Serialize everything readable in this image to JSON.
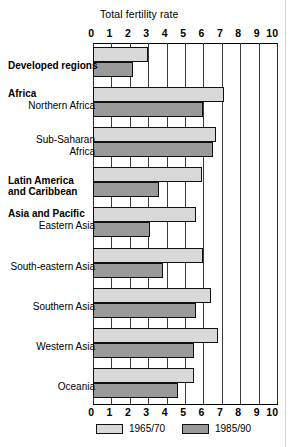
{
  "chart_data": {
    "type": "bar",
    "orientation": "horizontal",
    "title": "Total fertility rate",
    "xlabel": "",
    "ylabel": "",
    "xlim": [
      0,
      10
    ],
    "xticks": [
      0,
      1,
      2,
      3,
      4,
      5,
      6,
      7,
      8,
      9,
      10
    ],
    "xtick_labels": [
      "0",
      "1",
      "2",
      "3",
      "4",
      "5",
      "6",
      "7",
      "8",
      "9",
      "10"
    ],
    "grid": true,
    "axis_labels_position": "top-and-bottom",
    "legend_position": "bottom-center",
    "categories": [
      "Developed regions",
      "Northern Africa",
      "Sub-Saharan Africa",
      "Latin America and Caribbean",
      "Eastern Asia",
      "South-eastern Asia",
      "Southern Asia",
      "Western Asia",
      "Oceania"
    ],
    "series": [
      {
        "name": "1965/70",
        "color": "#d9d9d9",
        "values": [
          3.0,
          7.1,
          6.7,
          5.9,
          5.6,
          6.0,
          6.4,
          6.8,
          5.5
        ]
      },
      {
        "name": "1985/90",
        "color": "#9a9a9a",
        "values": [
          2.2,
          6.0,
          6.5,
          3.6,
          3.1,
          3.8,
          5.6,
          5.5,
          4.6
        ]
      }
    ]
  },
  "row_labels": [
    {
      "text": "Developed regions",
      "bold": true,
      "group_header": true
    },
    {
      "text": "Northern Africa",
      "bold": false,
      "group_header": false
    },
    {
      "text": "Sub-Saharan\nAfrica",
      "bold": false,
      "group_header": false
    },
    {
      "text": "Latin America\nand Caribbean",
      "bold": true,
      "group_header": true
    },
    {
      "text": "Eastern Asia",
      "bold": false,
      "group_header": false
    },
    {
      "text": "South-eastern Asia",
      "bold": false,
      "group_header": false
    },
    {
      "text": "Southern Asia",
      "bold": false,
      "group_header": false
    },
    {
      "text": "Western Asia",
      "bold": false,
      "group_header": false
    },
    {
      "text": "Oceania",
      "bold": false,
      "group_header": false
    }
  ],
  "group_headers": [
    {
      "text": "Africa"
    },
    {
      "text": "Asia and Pacific"
    }
  ],
  "legend": [
    {
      "label": "1965/70",
      "color": "#d9d9d9"
    },
    {
      "label": "1985/90",
      "color": "#9a9a9a"
    }
  ],
  "colors": {
    "series_1965": "#d9d9d9",
    "series_1985": "#9a9a9a",
    "grid": "#3a3a3a",
    "text": "#000000",
    "background": "#ffffff"
  }
}
